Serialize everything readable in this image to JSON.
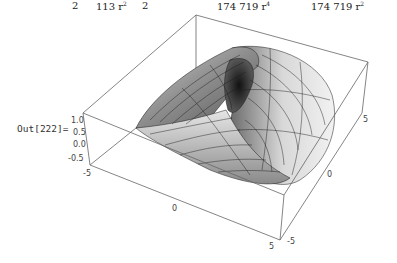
{
  "formula_fragments": [
    {
      "text": "2",
      "x": 72
    },
    {
      "text": "113 r",
      "sup": "2",
      "x": 96
    },
    {
      "text": "2",
      "x": 142
    },
    {
      "text": "174 719 r",
      "sup": "4",
      "x": 217
    },
    {
      "text": "174 719 r",
      "sup": "2",
      "x": 311
    }
  ],
  "output": {
    "label": "Out[222]="
  },
  "plot": {
    "type": "3d-surface",
    "z_ticks": [
      "1.0",
      "0.5",
      "0.0",
      "-0.5"
    ],
    "x_ticks": [
      "-5",
      "0",
      "5"
    ],
    "y_ticks": [
      "-5",
      "0",
      "5"
    ],
    "colors": {
      "box": "#555555",
      "surface_light": "#e8e8e8",
      "surface_dark": "#4a4a4a",
      "mesh": "#1a1a1a"
    }
  }
}
